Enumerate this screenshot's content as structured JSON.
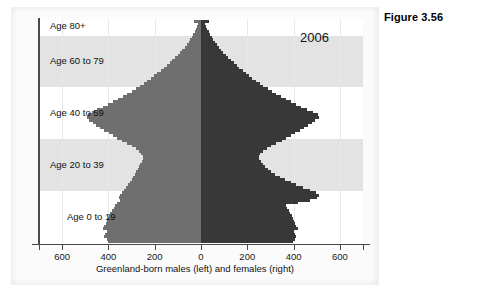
{
  "figure": {
    "caption": "Figure 3.56"
  },
  "chart_data": {
    "type": "bar",
    "subtype": "population-pyramid",
    "title": "",
    "year_annotation": "2006",
    "xlabel": "Greenland-born males (left) and females (right)",
    "ylabel": "",
    "xlim": [
      -700,
      700
    ],
    "xticks": [
      -600,
      -400,
      -200,
      0,
      200,
      400,
      600
    ],
    "xtick_labels": [
      "600",
      "400",
      "200",
      "0",
      "200",
      "400",
      "600"
    ],
    "ylim": [
      0,
      86
    ],
    "grid": "vertical",
    "legend_position": "none",
    "series": [
      {
        "name": "Greenland-born males (left)",
        "color": "#6f6f6f",
        "direction": "left",
        "values": [
          400,
          408,
          418,
          414,
          408,
          424,
          418,
          412,
          406,
          400,
          398,
          392,
          386,
          376,
          370,
          362,
          352,
          356,
          348,
          340,
          332,
          326,
          316,
          308,
          300,
          292,
          286,
          280,
          274,
          268,
          262,
          256,
          252,
          250,
          258,
          268,
          280,
          300,
          318,
          340,
          362,
          380,
          398,
          420,
          438,
          452,
          468,
          484,
          494,
          490,
          470,
          448,
          424,
          400,
          380,
          358,
          336,
          318,
          300,
          282,
          264,
          248,
          232,
          216,
          202,
          188,
          174,
          160,
          148,
          136,
          124,
          112,
          100,
          90,
          80,
          70,
          62,
          54,
          46,
          40,
          34,
          28,
          22,
          17,
          12,
          30
        ]
      },
      {
        "name": "Greenland-born females (right)",
        "color": "#383838",
        "direction": "right",
        "values": [
          398,
          406,
          412,
          408,
          402,
          418,
          412,
          406,
          400,
          396,
          392,
          386,
          380,
          372,
          366,
          420,
          470,
          500,
          508,
          496,
          470,
          440,
          412,
          388,
          364,
          340,
          320,
          304,
          290,
          278,
          268,
          258,
          252,
          250,
          256,
          268,
          284,
          304,
          326,
          348,
          368,
          388,
          408,
          428,
          446,
          462,
          478,
          492,
          510,
          504,
          482,
          458,
          434,
          410,
          388,
          366,
          344,
          324,
          306,
          288,
          270,
          254,
          238,
          222,
          208,
          194,
          180,
          166,
          154,
          142,
          130,
          118,
          106,
          96,
          86,
          76,
          68,
          60,
          52,
          46,
          40,
          33,
          27,
          21,
          16,
          36
        ]
      }
    ],
    "age_bands": [
      {
        "label": "Age 0 to 19",
        "age_min": 0,
        "age_max": 19,
        "shaded": false
      },
      {
        "label": "Age 20 to 39",
        "age_min": 20,
        "age_max": 39,
        "shaded": true
      },
      {
        "label": "Age 40 to 59",
        "age_min": 40,
        "age_max": 59,
        "shaded": false
      },
      {
        "label": "Age 60 to 79",
        "age_min": 60,
        "age_max": 79,
        "shaded": true
      },
      {
        "label": "Age 80+",
        "age_min": 80,
        "age_max": 86,
        "shaded": false
      }
    ]
  }
}
